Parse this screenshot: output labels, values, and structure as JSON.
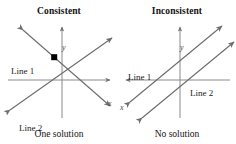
{
  "figure": {
    "width": 236,
    "height": 144,
    "background": "#ffffff",
    "stroke_color": "#5f5f5f",
    "axis_color": "#6e6e6e",
    "point_color": "#000000"
  },
  "panels": [
    {
      "id": "consistent",
      "title": "Consistent",
      "caption": "One solution",
      "axis": {
        "x_label": "x",
        "y_label": "y"
      },
      "lines": [
        {
          "label": "Line 1",
          "slope": "negative"
        },
        {
          "label": "Line 2",
          "slope": "positive"
        }
      ],
      "intersection": {
        "visible": true,
        "marker": "filled-square"
      }
    },
    {
      "id": "inconsistent",
      "title": "Inconsistent",
      "caption": "No solution",
      "axis": {
        "x_label": "x",
        "y_label": "y"
      },
      "lines": [
        {
          "label": "Line 1",
          "slope": "positive"
        },
        {
          "label": "Line 2",
          "slope": "positive"
        }
      ],
      "intersection": {
        "visible": false,
        "marker": "none"
      }
    }
  ]
}
